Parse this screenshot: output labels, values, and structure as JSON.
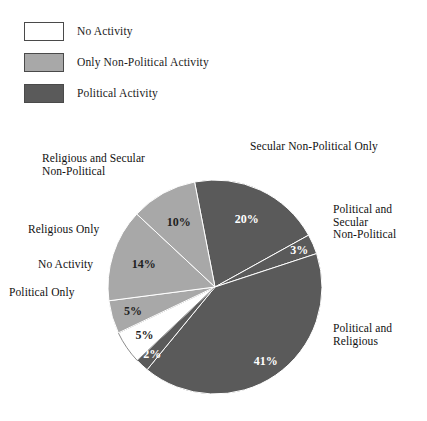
{
  "legend": {
    "items": [
      {
        "label": "No Activity",
        "swatch_name": "legend-swatch-no-activity",
        "color": "#ffffff"
      },
      {
        "label": "Only Non-Political Activity",
        "swatch_name": "legend-swatch-non-political",
        "color": "#a8a8a8"
      },
      {
        "label": "Political Activity",
        "swatch_name": "legend-swatch-political",
        "color": "#5a5a5a"
      }
    ]
  },
  "callouts": {
    "secular_non_political_only": "Secular Non-Political Only",
    "religious_and_secular_non_political": "Religious and Secular\nNon-Political",
    "religious_only": "Religious Only",
    "no_activity": "No Activity",
    "political_only": "Political Only",
    "political_and_secular_non_political": "Political and\nSecular\nNon-Political",
    "political_and_religious": "Political and\nReligious"
  },
  "chart_data": {
    "type": "pie",
    "title": "",
    "legend_position": "top-left",
    "value_unit": "%",
    "total": 100,
    "start_angle_deg": -11,
    "direction": "clockwise",
    "center": {
      "x": 215,
      "y": 287
    },
    "radius": 107,
    "categories": [
      "Political and Secular Non-Political",
      "Political and Religious",
      "Political, Religious and Secular Non-Political",
      "Political Only",
      "No Activity",
      "Religious Only",
      "Religious and Secular Non-Political",
      "Secular Non-Political Only"
    ],
    "values": [
      20,
      3,
      41,
      2,
      5,
      5,
      14,
      10
    ],
    "labels": [
      "20%",
      "3%",
      "41%",
      "2%",
      "5%",
      "5%",
      "14%",
      "10%"
    ],
    "colors": [
      "#5a5a5a",
      "#5a5a5a",
      "#5a5a5a",
      "#5a5a5a",
      "#ffffff",
      "#a8a8a8",
      "#a8a8a8",
      "#a8a8a8"
    ],
    "groups": [
      "Political Activity",
      "Political Activity",
      "Political Activity",
      "Political Activity",
      "No Activity",
      "Only Non-Political Activity",
      "Only Non-Political Activity",
      "Only Non-Political Activity"
    ]
  }
}
